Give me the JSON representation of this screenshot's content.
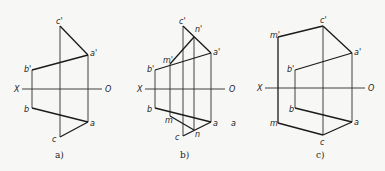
{
  "panels": [
    {
      "id": "a",
      "caption": "a)",
      "axis": {
        "x_label": "X",
        "o_label": "O"
      },
      "points": {
        "c_prime": "c'",
        "a_prime": "a'",
        "b_prime": "b'",
        "b": "b",
        "a": "a",
        "c": "c"
      }
    },
    {
      "id": "b",
      "caption": "b)",
      "axis": {
        "x_label": "X",
        "o_label": "O"
      },
      "points": {
        "c_prime": "c'",
        "n_prime": "n'",
        "a_prime": "a'",
        "m_prime": "m'",
        "b_prime": "b'",
        "b": "b",
        "m": "m",
        "a": "a",
        "n": "n",
        "c": "c"
      },
      "stray_label": "a"
    },
    {
      "id": "c",
      "caption": "c)",
      "axis": {
        "x_label": "X",
        "o_label": "O"
      },
      "points": {
        "c_prime": "c'",
        "m_prime": "m'",
        "a_prime": "a'",
        "b_prime": "b'",
        "b": "b",
        "m": "m",
        "a": "a",
        "c": "c"
      }
    }
  ],
  "colors": {
    "line": "#1a1a1a",
    "background": "#f7f7f5"
  }
}
